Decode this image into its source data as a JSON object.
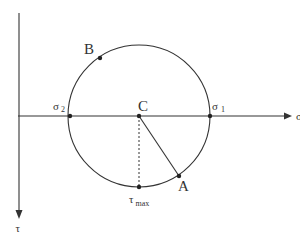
{
  "diagram": {
    "colors": {
      "stroke": "#333333",
      "background": "#ffffff"
    },
    "axes": {
      "sigma": {
        "label": "σ"
      },
      "tau": {
        "label": "τ"
      }
    },
    "points": {
      "A": {
        "label": "A"
      },
      "B": {
        "label": "B"
      },
      "C": {
        "label": "C"
      },
      "sigma1": {
        "label": "σ",
        "sub": "1"
      },
      "sigma2": {
        "label": "σ",
        "sub": "2"
      },
      "tau_max": {
        "label": "τ",
        "sub": "max"
      }
    }
  }
}
